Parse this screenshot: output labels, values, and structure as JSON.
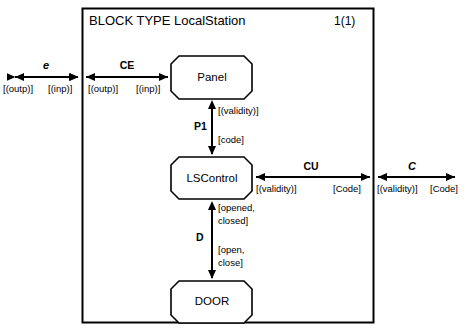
{
  "diagram": {
    "kind": "sdl-block-type-diagram",
    "title": "BLOCK TYPE LocalStation",
    "page_number": "1(1)",
    "frame": {
      "x": 82,
      "y": 8,
      "width": 292,
      "height": 315
    },
    "stroke_color": "#000000",
    "background": "#ffffff"
  },
  "blocks": [
    {
      "id": "panel",
      "label": "Panel",
      "x": 171,
      "y": 56,
      "width": 81,
      "height": 43
    },
    {
      "id": "lscontrol",
      "label": "LSControl",
      "x": 171,
      "y": 157,
      "width": 81,
      "height": 42
    },
    {
      "id": "door",
      "label": "DOOR",
      "x": 171,
      "y": 281,
      "width": 81,
      "height": 42
    }
  ],
  "gates": [
    {
      "id": "e",
      "name": "e",
      "side": "left",
      "y": 77,
      "out_signals": "[(outp)]",
      "in_signals": "[(inp)]"
    },
    {
      "id": "c",
      "name": "C",
      "side": "right",
      "y": 177,
      "in_signals": "[(validity)]",
      "out_signals": "[Code]"
    }
  ],
  "channels": [
    {
      "id": "ce",
      "name": "CE",
      "orientation": "horizontal",
      "y": 77,
      "from": "frame-left-border",
      "to": "panel",
      "left_signals": "[(outp)]",
      "right_signals": "[(inp)]"
    },
    {
      "id": "p1",
      "name": "P1",
      "orientation": "vertical",
      "x": 212,
      "from": "lscontrol",
      "to": "panel",
      "up_signals": "[(validity)]",
      "down_signals": "[code]"
    },
    {
      "id": "cu",
      "name": "CU",
      "orientation": "horizontal",
      "y": 177,
      "from": "lscontrol",
      "to": "frame-right-border",
      "left_signals": "[(validity)]",
      "right_signals": "[Code]"
    },
    {
      "id": "d",
      "name": "D",
      "orientation": "vertical",
      "x": 212,
      "from": "door",
      "to": "lscontrol",
      "up_signals_line1": "[opened,",
      "up_signals_line2": "closed]",
      "down_signals_line1": "[open,",
      "down_signals_line2": "close]"
    }
  ],
  "labels": {
    "gate_e_name": "e",
    "gate_e_left": "[(outp)]",
    "gate_e_right": "[(inp)]",
    "ce_name": "CE",
    "ce_left": "[(outp)]",
    "ce_right": "[(inp)]",
    "p1_name": "P1",
    "p1_up": "[(validity)]",
    "p1_down": "[code]",
    "cu_name": "CU",
    "cu_left": "[(validity)]",
    "cu_right": "[Code]",
    "gate_c_name": "C",
    "gate_c_left": "[(validity)]",
    "gate_c_right": "[Code]",
    "d_name": "D",
    "d_up_l1": "[opened,",
    "d_up_l2": "closed]",
    "d_down_l1": "[open,",
    "d_down_l2": "close]"
  }
}
